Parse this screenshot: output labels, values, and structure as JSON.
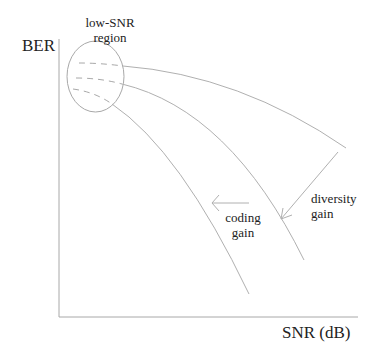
{
  "diagram": {
    "y_axis_label": "BER",
    "x_axis_label": "SNR (dB)",
    "region_label_line1": "low-SNR",
    "region_label_line2": "region",
    "coding_gain_line1": "coding",
    "coding_gain_line2": "gain",
    "diversity_gain_line1": "diversity",
    "diversity_gain_line2": "gain",
    "colors": {
      "axis": "#a8a8a8",
      "curve": "#b0b0b0",
      "arrow": "#b0b0b0",
      "text": "#222222"
    }
  }
}
